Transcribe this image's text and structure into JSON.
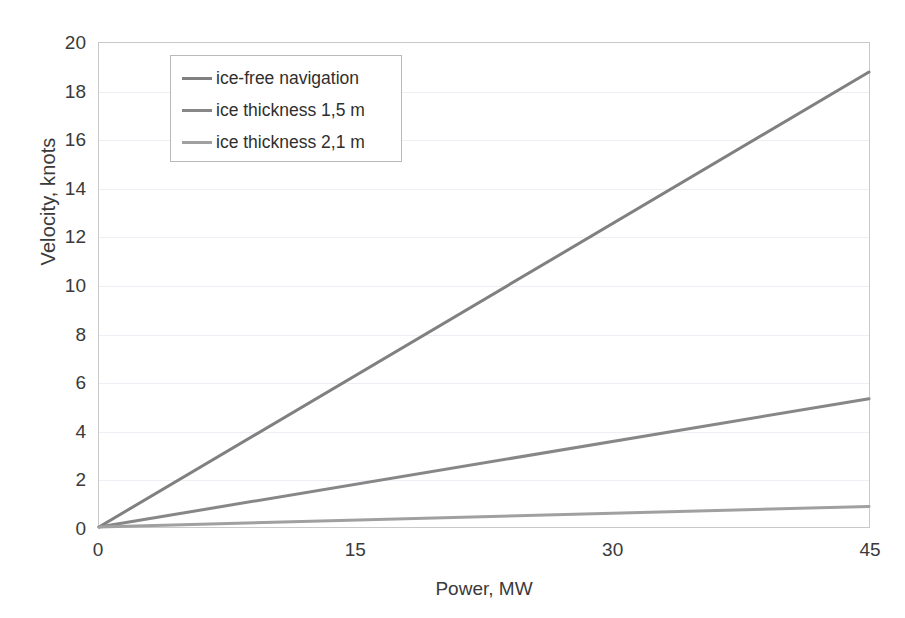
{
  "chart_data": {
    "type": "line",
    "title": "",
    "xlabel": "Power, MW",
    "ylabel": "Velocity, knots",
    "xlim": [
      0,
      45
    ],
    "ylim": [
      0,
      20
    ],
    "xticks": [
      0,
      15,
      30,
      45
    ],
    "yticks": [
      0,
      2,
      4,
      6,
      8,
      10,
      12,
      14,
      16,
      18,
      20
    ],
    "grid": true,
    "legend_position": "upper-left-inside",
    "x": [
      0,
      45
    ],
    "series": [
      {
        "name": "ice-free navigation",
        "color": "#808080",
        "values": [
          0,
          18.8
        ]
      },
      {
        "name": "ice thickness 1,5 m",
        "color": "#878787",
        "values": [
          0,
          5.3
        ]
      },
      {
        "name": "ice thickness 2,1 m",
        "color": "#a0a0a0",
        "values": [
          0,
          0.85
        ]
      }
    ]
  },
  "axes": {
    "y_title": "Velocity, knots",
    "x_title": "Power, MW",
    "y_tick_labels": [
      "20",
      "18",
      "16",
      "14",
      "12",
      "10",
      "8",
      "6",
      "4",
      "2",
      "0"
    ],
    "x_tick_labels": [
      "0",
      "15",
      "30",
      "45"
    ]
  },
  "legend": {
    "items": [
      {
        "label": "ice-free navigation"
      },
      {
        "label": "ice thickness 1,5 m"
      },
      {
        "label": "ice thickness 2,1 m"
      }
    ]
  }
}
